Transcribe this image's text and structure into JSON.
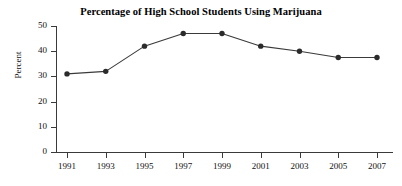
{
  "chart_data": {
    "type": "line",
    "title": "Percentage of High School Students Using Marijuana",
    "xlabel": "",
    "ylabel": "Percent",
    "categories": [
      "1991",
      "1993",
      "1995",
      "1997",
      "1999",
      "2001",
      "2003",
      "2005",
      "2007"
    ],
    "x": [
      1991,
      1993,
      1995,
      1997,
      1999,
      2001,
      2003,
      2005,
      2007
    ],
    "values": [
      31,
      32,
      42,
      47,
      47,
      42,
      40,
      37.5,
      37.5
    ],
    "series": [
      {
        "name": "Percentage of high school students using marijuana",
        "values": [
          31,
          32,
          42,
          47,
          47,
          42,
          40,
          37.5,
          37.5
        ]
      }
    ],
    "ylim": [
      0,
      50
    ],
    "yticks": [
      0,
      10,
      20,
      30,
      40,
      50
    ],
    "ytick_labels": [
      "0",
      "10",
      "20",
      "30",
      "40",
      "50"
    ],
    "xtick_labels": [
      "1991",
      "1993",
      "1995",
      "1997",
      "1999",
      "2001",
      "2003",
      "2005",
      "2007"
    ],
    "grid": false,
    "legend": "none",
    "marker": "filled-circle",
    "line_color": "#3a3a3a",
    "marker_color": "#2b2b2b",
    "background_color": "#ffffff"
  }
}
